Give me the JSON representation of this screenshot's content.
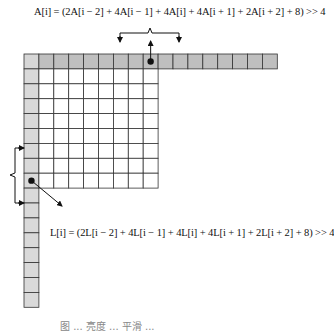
{
  "formulas": {
    "above": "A[i] = (2A[i − 2] + 4A[i − 1] + 4A[i] + 4A[i + 1] + 2A[i + 2] + 8) >> 4",
    "left": "L[i] = (2L[i − 2] + 4L[i − 1] + 4L[i] + 4L[i + 1] + 2L[i + 2] + 8) >> 4"
  },
  "grid": {
    "origin_x": 24,
    "origin_y": 54,
    "cell_size": 14.9,
    "top_row_cells": 16,
    "left_column_cells": 16,
    "block_cols": 8,
    "block_rows": 8,
    "highlighted_top_index": 8,
    "highlighted_left_index": 8
  },
  "colors": {
    "corner": "#d6d6d6",
    "top_row": "#bfbfbf",
    "left_column": "#d9d9d9",
    "block": "#ffffff",
    "grid_line": "#333333"
  },
  "caption": "图 ... 亮度 ... 平滑 ..."
}
